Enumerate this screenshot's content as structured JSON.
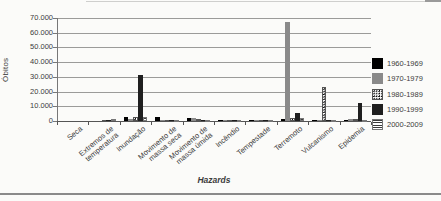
{
  "chart_data": {
    "type": "bar",
    "title": "",
    "xlabel": "Hazards",
    "ylabel": "Óbitos",
    "ylim": [
      0,
      70000
    ],
    "ytick_step": 10000,
    "ytick_labels": [
      "0",
      "10.000",
      "20.000",
      "30.000",
      "40.000",
      "50.000",
      "60.000",
      "70.000"
    ],
    "grid": true,
    "legend_position": "right",
    "categories": [
      [
        "Seca"
      ],
      [
        "Extremos de",
        "temperatura"
      ],
      [
        "Inundação"
      ],
      [
        "Movimento de",
        "massa seca"
      ],
      [
        "Movimento de",
        "massa úmida"
      ],
      [
        "Incêndio"
      ],
      [
        "Tempestade"
      ],
      [
        "Terremoto"
      ],
      [
        "Vulcanismo"
      ],
      [
        "Epidemia"
      ]
    ],
    "series": [
      {
        "name": "1960-1969",
        "pattern": "solid",
        "color": "#000000",
        "values": [
          0,
          0,
          2500,
          2500,
          1700,
          200,
          500,
          1200,
          200,
          800
        ]
      },
      {
        "name": "1970-1979",
        "pattern": "solid",
        "color": "#8a8a8a",
        "values": [
          0,
          0,
          1500,
          300,
          1800,
          100,
          600,
          67000,
          300,
          1500
        ]
      },
      {
        "name": "1980-1989",
        "pattern": "dots",
        "color": "#111111",
        "values": [
          0,
          200,
          3000,
          300,
          1300,
          100,
          500,
          2200,
          23000,
          1300
        ]
      },
      {
        "name": "1990-1999",
        "pattern": "solid",
        "color": "#1f1f1f",
        "values": [
          0,
          300,
          31000,
          400,
          900,
          200,
          700,
          5500,
          300,
          12000
        ]
      },
      {
        "name": "2000-2009",
        "pattern": "hlines",
        "color": "#3a3a3a",
        "values": [
          0,
          1500,
          2700,
          300,
          600,
          100,
          800,
          1800,
          200,
          300
        ]
      }
    ]
  }
}
